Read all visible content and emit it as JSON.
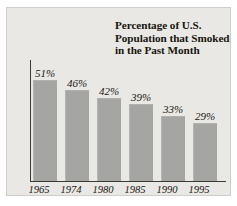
{
  "chart_data": {
    "type": "bar",
    "title": "Percentage of U.S. Population that Smoked in the Past Month",
    "title_lines": [
      "Percentage of U.S.",
      "Population that Smoked",
      "in the Past Month"
    ],
    "categories": [
      "1965",
      "1974",
      "1980",
      "1985",
      "1990",
      "1995"
    ],
    "values": [
      51,
      46,
      42,
      39,
      33,
      29
    ],
    "value_labels": [
      "51%",
      "46%",
      "42%",
      "39%",
      "33%",
      "29%"
    ],
    "xlabel": "",
    "ylabel": "",
    "ylim": [
      0,
      62
    ],
    "grid": false,
    "legend": false,
    "bar_color": "#a5a5a3",
    "panel_color": "#e9e8e5",
    "axis_color": "#3b3a34",
    "text_color": "#1a1912"
  }
}
